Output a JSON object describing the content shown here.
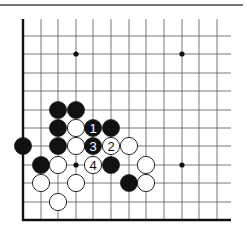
{
  "diagram": {
    "type": "go-board-corner",
    "colors": {
      "grid": "#555555",
      "edge": "#111111",
      "black": "#111111",
      "white": "#ffffff",
      "star": "#111111",
      "topline": "#777777"
    },
    "grid": {
      "cols_x": [
        23,
        41,
        58,
        76,
        93,
        111,
        129,
        146,
        164,
        182,
        199,
        217
      ],
      "rows_y": [
        36,
        54,
        73,
        91,
        110,
        128,
        146,
        165,
        183,
        202
      ],
      "top_y": 19,
      "right_x": 231,
      "left_edge_x": 23,
      "bottom_edge_y": 220
    },
    "star_points": [
      {
        "col": 3,
        "row": 1
      },
      {
        "col": 9,
        "row": 1
      },
      {
        "col": 3,
        "row": 7
      },
      {
        "col": 9,
        "row": 7
      }
    ],
    "stones": [
      {
        "color": "black",
        "col": 2,
        "row": 4,
        "label": ""
      },
      {
        "color": "black",
        "col": 3,
        "row": 4,
        "label": ""
      },
      {
        "color": "black",
        "col": 2,
        "row": 5,
        "label": ""
      },
      {
        "color": "white",
        "col": 3,
        "row": 5,
        "label": ""
      },
      {
        "color": "black",
        "col": 4,
        "row": 5,
        "label": "1"
      },
      {
        "color": "black",
        "col": 5,
        "row": 5,
        "label": ""
      },
      {
        "color": "black",
        "col": 0,
        "row": 6,
        "label": ""
      },
      {
        "color": "black",
        "col": 2,
        "row": 6,
        "label": ""
      },
      {
        "color": "white",
        "col": 3,
        "row": 6,
        "label": ""
      },
      {
        "color": "black",
        "col": 4,
        "row": 6,
        "label": "3"
      },
      {
        "color": "white",
        "col": 5,
        "row": 6,
        "label": "2"
      },
      {
        "color": "white",
        "col": 6,
        "row": 6,
        "label": ""
      },
      {
        "color": "black",
        "col": 1,
        "row": 7,
        "label": ""
      },
      {
        "color": "white",
        "col": 2,
        "row": 7,
        "label": ""
      },
      {
        "color": "white",
        "col": 4,
        "row": 7,
        "label": "4"
      },
      {
        "color": "black",
        "col": 5,
        "row": 7,
        "label": ""
      },
      {
        "color": "white",
        "col": 7,
        "row": 7,
        "label": ""
      },
      {
        "color": "white",
        "col": 1,
        "row": 8,
        "label": ""
      },
      {
        "color": "white",
        "col": 3,
        "row": 8,
        "label": ""
      },
      {
        "color": "black",
        "col": 6,
        "row": 8,
        "label": ""
      },
      {
        "color": "white",
        "col": 7,
        "row": 8,
        "label": ""
      },
      {
        "color": "white",
        "col": 2,
        "row": 9,
        "label": ""
      }
    ],
    "move_labels": [
      "1",
      "2",
      "3",
      "4"
    ]
  }
}
